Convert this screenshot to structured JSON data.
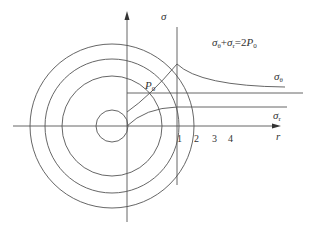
{
  "diagram": {
    "labels": {
      "sigma_axis": "σ",
      "r_axis": "r",
      "equation": {
        "s1": "σ",
        "sub1": "θ",
        "plus": "+",
        "s2": "σ",
        "sub2": "r",
        "eq": "=2",
        "p": "P",
        "sub3": "0"
      },
      "sigma_theta": {
        "s": "σ",
        "sub": "θ"
      },
      "sigma_r": {
        "s": "σ",
        "sub": "r"
      },
      "p0": {
        "p": "P",
        "sub": "0"
      }
    },
    "zone_numbers": [
      "1",
      "2",
      "3",
      "4"
    ],
    "stroke_color": "#555555"
  }
}
